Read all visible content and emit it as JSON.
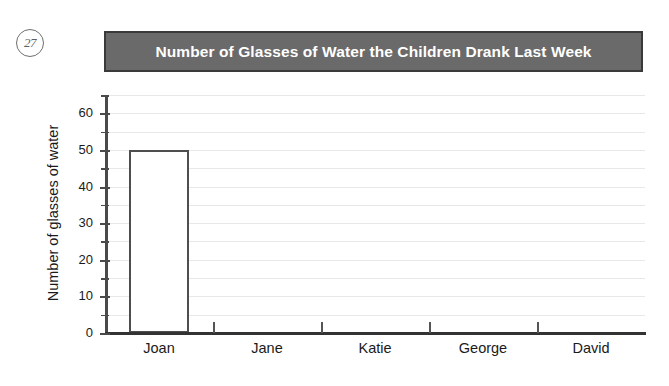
{
  "question_marker": "27",
  "chart_data": {
    "type": "bar",
    "title": "Number of Glasses of Water the Children Drank Last Week",
    "xlabel": "",
    "ylabel": "Number of glasses of water",
    "categories": [
      "Joan",
      "Jane",
      "Katie",
      "George",
      "David"
    ],
    "values": [
      50,
      0,
      0,
      0,
      0
    ],
    "ylim": [
      0,
      65
    ],
    "y_major_ticks": [
      0,
      10,
      20,
      30,
      40,
      50,
      60
    ],
    "y_minor_ticks": [
      5,
      15,
      25,
      35,
      45,
      55,
      65
    ],
    "y_tick_labels": [
      "0",
      "10",
      "20",
      "30",
      "40",
      "50",
      "60"
    ],
    "grid": true,
    "grid_interval": 5,
    "legend": null,
    "bar_style": "outlined",
    "colors": {
      "title_banner_background": "#6a6a6a",
      "title_banner_border": "#3a3a3a",
      "title_text": "#ffffff",
      "bar_fill": "#ffffff",
      "bar_outline": "#4e4e4e",
      "gridline": "#e8e8e8",
      "axis": "#333333",
      "page_background": "#ffffff"
    }
  }
}
